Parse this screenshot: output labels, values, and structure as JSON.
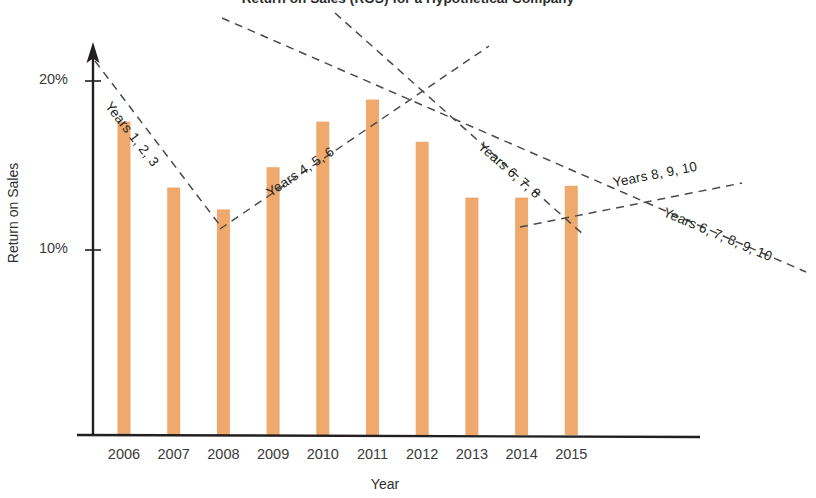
{
  "chart_data": {
    "type": "bar",
    "title": "Return on Sales (ROS) for a Hypothetical Company",
    "xlabel": "Year",
    "ylabel": "Return on Sales",
    "categories": [
      "2006",
      "2007",
      "2008",
      "2009",
      "2010",
      "2011",
      "2012",
      "2013",
      "2014",
      "2015"
    ],
    "values": [
      17.6,
      13.7,
      12.4,
      14.9,
      17.6,
      18.9,
      16.4,
      13.1,
      13.1,
      13.8
    ],
    "value_unit": "%",
    "ytick_labels": [
      "20%",
      "10%"
    ],
    "ytick_values": [
      20,
      10
    ],
    "ylim": [
      0,
      21
    ],
    "grid": false,
    "legend": false,
    "bar_color": "#efa96c",
    "axis_color": "#231f20",
    "trendline_color": "#4a4a4a",
    "trendlines": [
      {
        "label": "Years 1, 2, 3",
        "covers": [
          "2006",
          "2007",
          "2008"
        ],
        "direction": "down",
        "x1": 95,
        "y1": 61,
        "x2": 222,
        "y2": 228,
        "label_x": 108,
        "label_y": 96,
        "label_angle": 52
      },
      {
        "label": "Years 4, 5, 6",
        "covers": [
          "2009",
          "2010",
          "2011"
        ],
        "direction": "up",
        "x1": 220,
        "y1": 229,
        "x2": 489,
        "y2": 46,
        "label_x": 268,
        "label_y": 186,
        "label_angle": -34
      },
      {
        "label": "Years 6, 7, 8",
        "covers": [
          "2011",
          "2012",
          "2013"
        ],
        "direction": "down",
        "x1": 335,
        "y1": 13,
        "x2": 585,
        "y2": 236,
        "label_x": 480,
        "label_y": 137,
        "label_angle": 41
      },
      {
        "label": "Years 8, 9, 10",
        "covers": [
          "2013",
          "2014",
          "2015"
        ],
        "direction": "up",
        "x1": 520,
        "y1": 227,
        "x2": 742,
        "y2": 183,
        "label_x": 613,
        "label_y": 175,
        "label_angle": -11
      },
      {
        "label": "Years 6, 7, 8, 9, 10",
        "covers": [
          "2011",
          "2012",
          "2013",
          "2014",
          "2015"
        ],
        "direction": "down",
        "x1": 222,
        "y1": 18,
        "x2": 806,
        "y2": 272,
        "label_x": 664,
        "label_y": 204,
        "label_angle": 23
      }
    ]
  }
}
